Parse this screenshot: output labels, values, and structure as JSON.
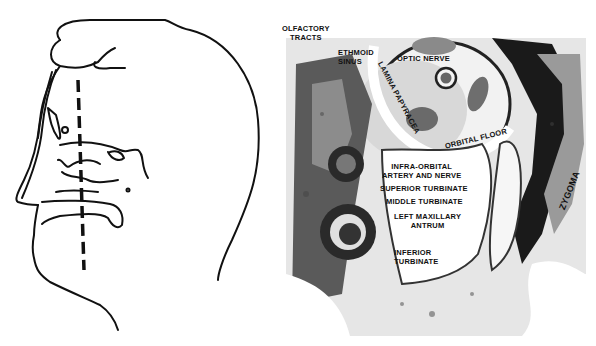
{
  "figure": {
    "left_panel": {
      "description": "Lateral profile of head with dashed vertical line indicating coronal section plane"
    },
    "right_panel": {
      "description": "Coronal histological section through orbit and nasal cavity",
      "labels": {
        "olfactory_tracts_1": "OLFACTORY",
        "olfactory_tracts_2": "TRACTS",
        "ethmoid_sinus_1": "ETHMOID",
        "ethmoid_sinus_2": "SINUS",
        "lamina_papyracea": "LAMINA PAPYRACEA",
        "optic_nerve": "OPTIC NERVE",
        "orbital_floor": "ORBITAL FLOOR",
        "infra_orbital_1": "INFRA-ORBITAL",
        "infra_orbital_2": "ARTERY AND NERVE",
        "superior_turbinate": "SUPERIOR TURBINATE",
        "middle_turbinate": "MIDDLE TURBINATE",
        "left_maxillary_1": "LEFT MAXILLARY",
        "left_maxillary_2": "ANTRUM",
        "inferior_turbinate_1": "INFERIOR",
        "inferior_turbinate_2": "TURBINATE",
        "zygoma": "ZYGOMA"
      }
    }
  },
  "colors": {
    "ink": "#111111",
    "tissue_dark": "#1a1a1a",
    "tissue_mid": "#7a7a7a",
    "tissue_light": "#cfcfcf",
    "paper": "#ffffff"
  }
}
